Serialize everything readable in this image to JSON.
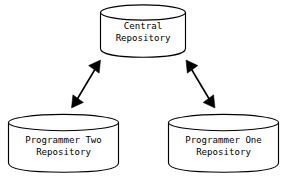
{
  "diagram": {
    "background_color": "#ffffff",
    "line_color": "#000000",
    "nodes": [
      {
        "id": "central",
        "shape": "cylinder",
        "label_line1": "Central",
        "label_line2": "Repository",
        "position": "top-center"
      },
      {
        "id": "programmer-two",
        "shape": "cylinder",
        "label_line1": "Programmer Two",
        "label_line2": "Repository",
        "position": "bottom-left"
      },
      {
        "id": "programmer-one",
        "shape": "cylinder",
        "label_line1": "Programmer One",
        "label_line2": "Repository",
        "position": "bottom-right"
      }
    ],
    "connectors": [
      {
        "id": "central-to-programmer-two",
        "from": "central",
        "to": "programmer-two",
        "style": "double-headed-arrow"
      },
      {
        "id": "central-to-programmer-one",
        "from": "central",
        "to": "programmer-one",
        "style": "double-headed-arrow"
      }
    ]
  }
}
